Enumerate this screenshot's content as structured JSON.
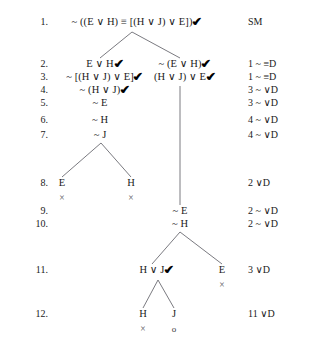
{
  "document": {
    "kind": "truth-tree",
    "title": "Truth tree for ~ ((E v H) = [(H v J) v E])",
    "symbols": {
      "negation": "~",
      "disjunction": "∨",
      "equivalence": "≡",
      "check": "✔",
      "closed": "×",
      "open": "o"
    }
  },
  "colors": {
    "background": "#ffffff",
    "text": "#1a1a1a",
    "branch_line": "#6b6b72",
    "close_mark": "#55555c"
  },
  "rows": [
    {
      "number": "1.",
      "y": 24,
      "justification": "SM",
      "nodes": [
        {
          "text": "~ ((E ∨ H) ≡ [(H ∨ J) ∨ E])",
          "x": 132,
          "checked": true
        }
      ]
    },
    {
      "number": "2.",
      "y": 66,
      "justification": "1 ~ ≡D",
      "nodes": [
        {
          "text": "E ∨ H",
          "x": 100,
          "checked": true
        },
        {
          "text": "~ (E ∨ H)",
          "x": 180,
          "checked": true
        }
      ]
    },
    {
      "number": "3.",
      "y": 79,
      "justification": "1 ~ ≡D",
      "nodes": [
        {
          "text": "~ [(H ∨ J) ∨ E]",
          "x": 100,
          "checked": true
        },
        {
          "text": "(H ∨ J) ∨ E",
          "x": 180,
          "checked": true
        }
      ]
    },
    {
      "number": "4.",
      "y": 92,
      "justification": "3 ~ ∨D",
      "nodes": [
        {
          "text": "~ (H ∨ J)",
          "x": 100,
          "checked": true
        }
      ]
    },
    {
      "number": "5.",
      "y": 105,
      "justification": "3 ~ ∨D",
      "nodes": [
        {
          "text": "~ E",
          "x": 100,
          "checked": false
        }
      ]
    },
    {
      "number": "6.",
      "y": 122,
      "justification": "4 ~ ∨D",
      "nodes": [
        {
          "text": "~ H",
          "x": 100,
          "checked": false
        }
      ]
    },
    {
      "number": "7.",
      "y": 137,
      "justification": "4 ~ ∨D",
      "nodes": [
        {
          "text": "~ J",
          "x": 100,
          "checked": false
        }
      ]
    },
    {
      "number": "8.",
      "y": 185,
      "justification": "2 ∨D",
      "nodes": [
        {
          "text": "E",
          "x": 62,
          "checked": false,
          "mark": "closed",
          "mark_y": 199
        },
        {
          "text": "H",
          "x": 131,
          "checked": false,
          "mark": "closed",
          "mark_y": 199
        }
      ]
    },
    {
      "number": "9.",
      "y": 213,
      "justification": "2 ~ ∨D",
      "nodes": [
        {
          "text": "~ E",
          "x": 180,
          "checked": false
        }
      ]
    },
    {
      "number": "10.",
      "y": 226,
      "justification": "2 ~ ∨D",
      "nodes": [
        {
          "text": "~ H",
          "x": 180,
          "checked": false
        }
      ]
    },
    {
      "number": "11.",
      "y": 272,
      "justification": "3 ∨D",
      "nodes": [
        {
          "text": "H ∨ J",
          "x": 152,
          "checked": true
        },
        {
          "text": "E",
          "x": 222,
          "checked": false,
          "mark": "closed",
          "mark_y": 286
        }
      ]
    },
    {
      "number": "12.",
      "y": 316,
      "justification": "11 ∨D",
      "nodes": [
        {
          "text": "H",
          "x": 143,
          "checked": false,
          "mark": "closed",
          "mark_y": 330
        },
        {
          "text": "J",
          "x": 174,
          "checked": false,
          "mark": "open",
          "mark_y": 330
        }
      ]
    }
  ],
  "branch_lines": [
    {
      "name": "root-split-left",
      "x1": 132,
      "y1": 32,
      "x2": 100,
      "y2": 58
    },
    {
      "name": "root-split-right",
      "x1": 132,
      "y1": 32,
      "x2": 180,
      "y2": 58
    },
    {
      "name": "trunk-middle",
      "x1": 180,
      "y1": 86,
      "x2": 180,
      "y2": 205
    },
    {
      "name": "line7-split-left",
      "x1": 101,
      "y1": 143,
      "x2": 62,
      "y2": 177
    },
    {
      "name": "line7-split-right",
      "x1": 101,
      "y1": 143,
      "x2": 131,
      "y2": 177
    },
    {
      "name": "line10-split-left",
      "x1": 180,
      "y1": 232,
      "x2": 152,
      "y2": 264
    },
    {
      "name": "line10-split-right",
      "x1": 180,
      "y1": 232,
      "x2": 222,
      "y2": 264
    },
    {
      "name": "line11-split-left",
      "x1": 158,
      "y1": 280,
      "x2": 143,
      "y2": 308
    },
    {
      "name": "line11-split-right",
      "x1": 158,
      "y1": 280,
      "x2": 174,
      "y2": 308
    }
  ],
  "layout": {
    "number_column_right_x": 48,
    "justification_column_x": 248
  }
}
